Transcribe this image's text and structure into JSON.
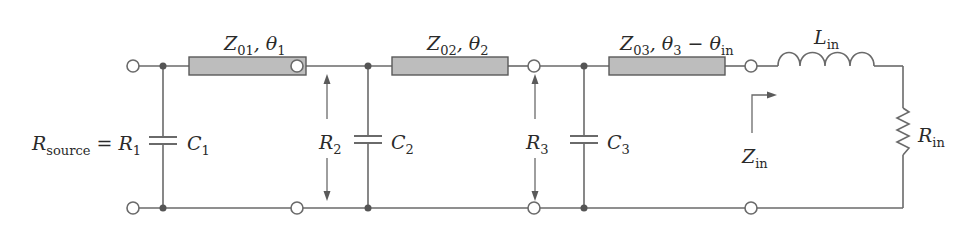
{
  "figure": {
    "type": "circuit-schematic"
  },
  "colors": {
    "wire": "#6a6a6a",
    "transmission_line_fill": "#bdbdbd",
    "junction": "#555555",
    "text": "#2a2a2a"
  },
  "source": {
    "label_main": "R",
    "label_sub": "source",
    "equals": " = ",
    "value_main": "R",
    "value_sub": "1"
  },
  "capacitors": [
    {
      "main": "C",
      "sub": "1"
    },
    {
      "main": "C",
      "sub": "2"
    },
    {
      "main": "C",
      "sub": "3"
    }
  ],
  "resistances": [
    {
      "main": "R",
      "sub": "2"
    },
    {
      "main": "R",
      "sub": "3"
    }
  ],
  "transmission_lines": [
    {
      "z_main": "Z",
      "z_sub": "01",
      "sep": ", ",
      "theta_main": "θ",
      "theta_sub": "1",
      "extra": "",
      "extra_sub": ""
    },
    {
      "z_main": "Z",
      "z_sub": "02",
      "sep": ", ",
      "theta_main": "θ",
      "theta_sub": "2",
      "extra": "",
      "extra_sub": ""
    },
    {
      "z_main": "Z",
      "z_sub": "03",
      "sep": ", ",
      "theta_main": "θ",
      "theta_sub": "3",
      "extra": " − θ",
      "extra_sub": "in"
    }
  ],
  "load": {
    "inductor": {
      "main": "L",
      "sub": "in"
    },
    "resistor": {
      "main": "R",
      "sub": "in"
    },
    "input_impedance": {
      "main": "Z",
      "sub": "in"
    }
  }
}
